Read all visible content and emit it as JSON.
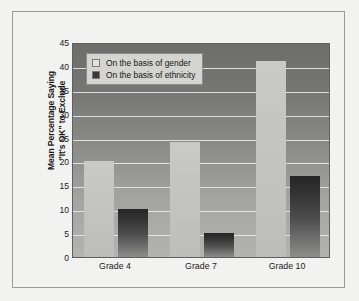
{
  "chart_data": {
    "type": "bar",
    "title": "",
    "subtitle": "",
    "xlabel": "",
    "ylabel": "Mean Percentage Saying \"It's OK\" to Exclude",
    "ylabel_lines": [
      "Mean Percentage Saying",
      "\"It's OK\" to Exclude"
    ],
    "categories": [
      "Grade 4",
      "Grade 7",
      "Grade 10"
    ],
    "series": [
      {
        "name": "On the basis of gender",
        "values": [
          20,
          24,
          41
        ],
        "color": "#c4c4c0"
      },
      {
        "name": "On the basis of ethnicity",
        "values": [
          10,
          5,
          17
        ],
        "color": "#333333"
      }
    ],
    "ylim": [
      0,
      45
    ],
    "ytick_step": 5,
    "yticks": [
      "0",
      "5",
      "10",
      "15",
      "20",
      "25",
      "30",
      "35",
      "40",
      "45"
    ],
    "grid": true,
    "grid_color": "#e8e8e6",
    "legend_position": "top-left",
    "plot_background": "gradient-gray",
    "frame": true
  }
}
